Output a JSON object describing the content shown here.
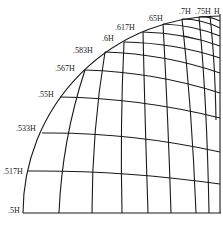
{
  "diagram": {
    "type": "quarter-disc curvilinear grid",
    "stroke_color": "#1a1a1a",
    "background": "#ffffff",
    "arc_labels": [
      {
        "text": ".5H",
        "x": 8,
        "y": 207
      },
      {
        "text": ".517H",
        "x": 3,
        "y": 168
      },
      {
        "text": ".533H",
        "x": 16,
        "y": 125
      },
      {
        "text": ".55H",
        "x": 38,
        "y": 91
      },
      {
        "text": ".567H",
        "x": 55,
        "y": 65
      },
      {
        "text": ".583H",
        "x": 73,
        "y": 47
      },
      {
        "text": ".6H",
        "x": 102,
        "y": 35
      },
      {
        "text": ".617H",
        "x": 115,
        "y": 24
      },
      {
        "text": ".65H",
        "x": 147,
        "y": 15
      },
      {
        "text": ".7H",
        "x": 179,
        "y": 8
      },
      {
        "text": ".75H",
        "x": 195,
        "y": 8
      },
      {
        "text": "H",
        "x": 214,
        "y": 8
      }
    ]
  }
}
